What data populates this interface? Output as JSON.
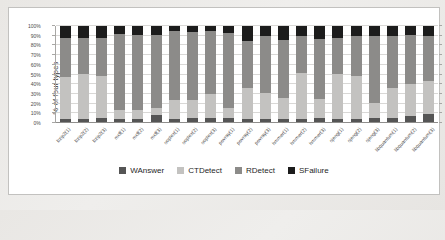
{
  "figure": {
    "background": "#ffffff",
    "border_color": "#c2c1bf",
    "outer_background": "#eceae7"
  },
  "chart_data": {
    "type": "bar",
    "subtype": "100%-stacked-column",
    "title": "",
    "xlabel": "",
    "ylabel": "% of four types",
    "ylim": [
      0,
      100
    ],
    "grid": true,
    "legend_position": "bottom",
    "y_ticks": [
      "0%",
      "10%",
      "20%",
      "30%",
      "40%",
      "50%",
      "60%",
      "70%",
      "80%",
      "90%",
      "100%"
    ],
    "categories": [
      "bzip2(1)",
      "bzip2(2)",
      "bzip2(3)",
      "mcf(1)",
      "mcf(2)",
      "mcf(3)",
      "soplex(1)",
      "soplex(2)",
      "soplex(3)",
      "povray(1)",
      "povray(2)",
      "povray(3)",
      "hmmer(1)",
      "hmmer(2)",
      "hmmer(3)",
      "sjeng(1)",
      "sjeng(2)",
      "sjeng(3)",
      "libquantum(1)",
      "libquantum(2)",
      "libquantum(3)"
    ],
    "series": [
      {
        "name": "WAnswer",
        "color": "#555555",
        "values": [
          4,
          4,
          5,
          4,
          4,
          8,
          4,
          5,
          5,
          5,
          4,
          4,
          4,
          4,
          5,
          4,
          4,
          5,
          5,
          7,
          9
        ]
      },
      {
        "name": "CTDetect",
        "color": "#c3c2c0",
        "values": [
          43,
          47,
          43,
          9,
          9,
          8,
          20,
          19,
          25,
          11,
          32,
          27,
          22,
          48,
          20,
          47,
          44,
          16,
          31,
          33,
          34
        ]
      },
      {
        "name": "RDetect",
        "color": "#8c8b89",
        "values": [
          41,
          37,
          40,
          79,
          78,
          75,
          71,
          70,
          65,
          77,
          49,
          59,
          60,
          38,
          62,
          37,
          42,
          69,
          54,
          51,
          47
        ]
      },
      {
        "name": "SFailure",
        "color": "#1c1c1c",
        "values": [
          12,
          12,
          12,
          8,
          9,
          9,
          5,
          6,
          5,
          7,
          15,
          10,
          14,
          10,
          13,
          12,
          10,
          10,
          10,
          9,
          10
        ]
      }
    ]
  }
}
